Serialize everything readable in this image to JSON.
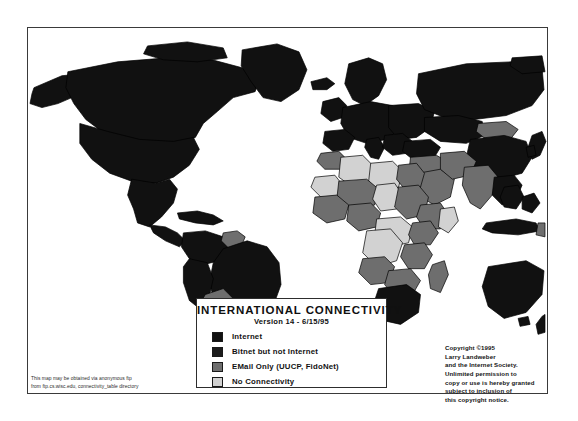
{
  "legend": {
    "title": "INTERNATIONAL CONNECTIVITY",
    "version": "Version 14 - 6/15/95",
    "items": [
      {
        "label": "Internet",
        "color": "#111111",
        "key": "internet"
      },
      {
        "label": "Bitnet but not Internet",
        "color": "#1c1c1c",
        "key": "bitnet"
      },
      {
        "label": "EMail Only (UUCP, FidoNet)",
        "color": "#6e6e6e",
        "key": "email-only"
      },
      {
        "label": "No Connectivity",
        "color": "#d2d2d2",
        "key": "no-connectivity"
      }
    ]
  },
  "copyright": {
    "line1": "Copyright ©1995",
    "line2": "Larry Landweber",
    "line3": "and the Internet Society.",
    "line4": "Unlimited permission to",
    "line5": "copy or use is hereby granted",
    "line6": "subject to inclusion of",
    "line7": "this copyright notice."
  },
  "ftp_note": {
    "line1": "This map may be obtained via anonymous ftp",
    "line2": "from ftp.cs.wisc.edu, connectivity_table directory"
  },
  "colors": {
    "internet": "#111111",
    "bitnet": "#1c1c1c",
    "email_only": "#6e6e6e",
    "no_connectivity": "#d2d2d2",
    "background": "#ffffff",
    "frame": "#3a3a3a",
    "country_outline": "#000000"
  }
}
